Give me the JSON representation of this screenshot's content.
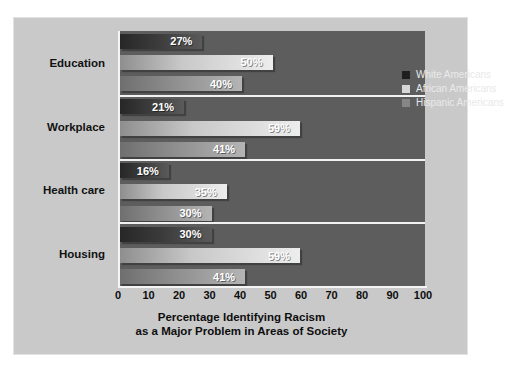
{
  "top_caption": "",
  "chart_data": {
    "type": "bar",
    "orientation": "horizontal",
    "title": "",
    "xlabel": "Percentage Identifying Racism as a Major Problem in Areas of Society",
    "xlabel_lines": [
      "Percentage Identifying Racism",
      "as a Major Problem in Areas of Society"
    ],
    "ylabel": "",
    "categories": [
      "Education",
      "Workplace",
      "Health care",
      "Housing"
    ],
    "series": [
      {
        "name": "White Americans",
        "color": "#272727",
        "values": [
          27,
          21,
          16,
          30
        ],
        "labels": [
          "27%",
          "21%",
          "16%",
          "30%"
        ]
      },
      {
        "name": "African Americans",
        "color": "#d7d7d7",
        "values": [
          50,
          59,
          35,
          59
        ],
        "labels": [
          "50%",
          "59%",
          "35%",
          "59%"
        ]
      },
      {
        "name": "Hispanic Americans",
        "color": "#868686",
        "values": [
          40,
          41,
          30,
          41
        ],
        "labels": [
          "40%",
          "41%",
          "30%",
          "41%"
        ]
      }
    ],
    "xlim": [
      0,
      100
    ],
    "xticks": [
      0,
      10,
      20,
      30,
      40,
      50,
      60,
      70,
      80,
      90,
      100
    ],
    "xtick_labels": [
      "0",
      "10",
      "20",
      "30",
      "40",
      "50",
      "60",
      "70",
      "80",
      "90",
      "100"
    ],
    "grid": false,
    "legend_position": "top-right",
    "plot_background": "#5d5d5d",
    "figure_background": "#c9c9c9"
  }
}
